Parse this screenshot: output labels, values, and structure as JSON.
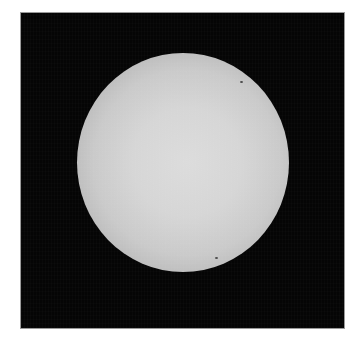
{
  "image": {
    "subject": "solar-disk",
    "description": "Grayscale photograph of the Sun's disk on a black background",
    "colors": {
      "background": "#050505",
      "disk_center": "#dcdcdc",
      "disk_limb": "#8a8a8a",
      "page": "#ffffff"
    },
    "spots": [
      {
        "name": "sunspot-1",
        "x": 240,
        "y": 81
      },
      {
        "name": "sunspot-2",
        "x": 215,
        "y": 257
      }
    ]
  }
}
